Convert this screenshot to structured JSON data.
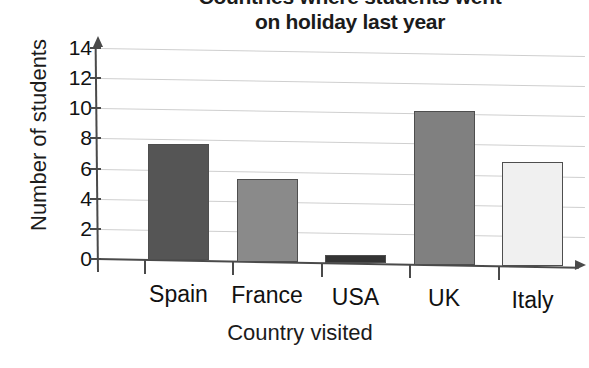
{
  "chart_data": {
    "type": "bar",
    "title": "Countries where students went on holiday last year",
    "title_line1": "Countries where students went",
    "title_line2": "on holiday last year",
    "xlabel": "Country visited",
    "ylabel": "Number of students",
    "categories": [
      "Spain",
      "France",
      "USA",
      "UK",
      "Italy"
    ],
    "values": [
      7.7,
      5.5,
      0.55,
      10.2,
      6.9
    ],
    "bar_colors": [
      "#555555",
      "#8a8a8a",
      "#343434",
      "#808080",
      "#f0f0f0"
    ],
    "bar_border_color": "#4e4e4e",
    "ylim": [
      0,
      14
    ],
    "ytick_labels": [
      "0",
      "2",
      "4",
      "6",
      "8",
      "10",
      "12",
      "14"
    ],
    "ytick_values": [
      0,
      2,
      4,
      6,
      8,
      10,
      12,
      14
    ],
    "ytick_interval": 2,
    "grid": true,
    "grid_axis": "y",
    "grid_color": "#cfcfcf",
    "legend": null,
    "axis_color": "#4a4a4a",
    "background": "#ffffff"
  },
  "notes": {
    "title_cropped": "first title line is clipped by the top edge of the screenshot"
  }
}
